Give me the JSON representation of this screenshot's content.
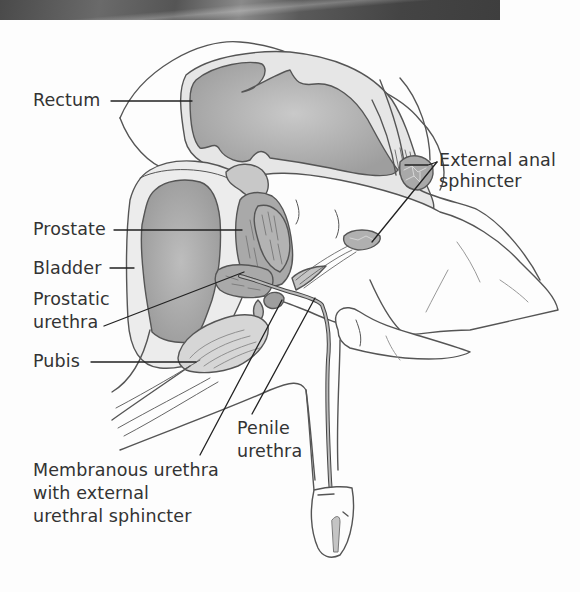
{
  "diagram": {
    "labels": {
      "rectum": "Rectum",
      "external_anal_sphincter_1": "External anal",
      "external_anal_sphincter_2": "sphincter",
      "prostate": "Prostate",
      "bladder": "Bladder",
      "prostatic_urethra_1": "Prostatic",
      "prostatic_urethra_2": "urethra",
      "pubis": "Pubis",
      "penile_urethra_1": "Penile",
      "penile_urethra_2": "urethra",
      "membranous_urethra_1": "Membranous urethra",
      "membranous_urethra_2": "with external",
      "membranous_urethra_3": "urethral sphincter"
    },
    "colors": {
      "outline": "#555555",
      "organ_fill": "#b8b8b8",
      "tissue_fill": "#e4e4e4",
      "leader_line": "#222222",
      "text": "#333333",
      "banner": "#5a5a5a"
    }
  }
}
